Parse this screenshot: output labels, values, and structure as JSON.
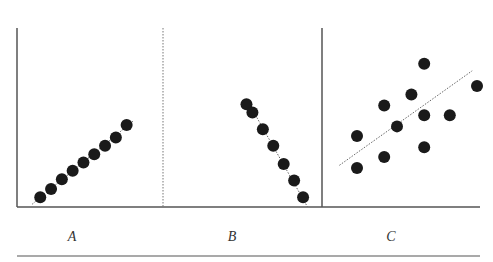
{
  "chart_data": [
    {
      "type": "scatter",
      "title": "",
      "panel_label": "A",
      "description": "Strong positive linear correlation",
      "xlabel": "",
      "ylabel": "",
      "xlim": [
        0,
        10
      ],
      "ylim": [
        0,
        10
      ],
      "grid": false,
      "points": [
        {
          "x": 1.5,
          "y": 0.7
        },
        {
          "x": 2.3,
          "y": 1.3
        },
        {
          "x": 3.1,
          "y": 2.0
        },
        {
          "x": 3.9,
          "y": 2.6
        },
        {
          "x": 4.7,
          "y": 3.2
        },
        {
          "x": 5.5,
          "y": 3.8
        },
        {
          "x": 6.3,
          "y": 4.4
        },
        {
          "x": 7.1,
          "y": 5.0
        },
        {
          "x": 7.9,
          "y": 5.9
        }
      ],
      "trendline": {
        "from": {
          "x": 0.9,
          "y": 0.2
        },
        "to": {
          "x": 8.4,
          "y": 6.2
        },
        "style": "dotted"
      }
    },
    {
      "type": "scatter",
      "title": "",
      "panel_label": "B",
      "description": "Strong negative linear correlation",
      "xlabel": "",
      "ylabel": "",
      "xlim": [
        0,
        10
      ],
      "ylim": [
        0,
        10
      ],
      "grid": false,
      "points": [
        {
          "x": 5.4,
          "y": 7.4
        },
        {
          "x": 5.8,
          "y": 6.8
        },
        {
          "x": 6.5,
          "y": 5.6
        },
        {
          "x": 7.2,
          "y": 4.4
        },
        {
          "x": 7.9,
          "y": 3.1
        },
        {
          "x": 8.6,
          "y": 1.9
        },
        {
          "x": 9.2,
          "y": 0.7
        }
      ],
      "trendline": {
        "from": {
          "x": 5.8,
          "y": 7.0
        },
        "to": {
          "x": 9.5,
          "y": 0.0
        },
        "style": "dotted"
      }
    },
    {
      "type": "scatter",
      "title": "",
      "panel_label": "C",
      "description": "Weak positive correlation",
      "xlabel": "",
      "ylabel": "",
      "xlim": [
        0,
        10
      ],
      "ylim": [
        0,
        10
      ],
      "grid": false,
      "points": [
        {
          "x": 6.2,
          "y": 10.3
        },
        {
          "x": 9.5,
          "y": 8.7
        },
        {
          "x": 5.4,
          "y": 8.1
        },
        {
          "x": 3.7,
          "y": 7.3
        },
        {
          "x": 6.2,
          "y": 6.6
        },
        {
          "x": 7.8,
          "y": 6.6
        },
        {
          "x": 4.5,
          "y": 5.8
        },
        {
          "x": 2.0,
          "y": 5.1
        },
        {
          "x": 6.2,
          "y": 4.3
        },
        {
          "x": 3.7,
          "y": 3.6
        },
        {
          "x": 2.0,
          "y": 2.8
        }
      ],
      "trendline": {
        "from": {
          "x": 0.9,
          "y": 3.0
        },
        "to": {
          "x": 9.2,
          "y": 9.8
        },
        "style": "dotted"
      }
    }
  ]
}
